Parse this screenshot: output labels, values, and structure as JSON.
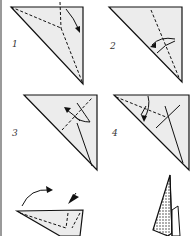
{
  "diagram": {
    "type": "origami-instructions",
    "steps": [
      {
        "number": "1",
        "description": "Triangle with valley folds meeting at center, arrow folding right flap down"
      },
      {
        "number": "2",
        "description": "Triangle with vertical valley fold, curved arrow folding left"
      },
      {
        "number": "3",
        "description": "Triangle with folds, curved arrow folding up-left"
      },
      {
        "number": "4",
        "description": "Triangle with dashed fold line, arrow folding down"
      },
      {
        "number": "",
        "description": "Model with curved arrow turning over and push-in arrow"
      },
      {
        "number": "",
        "description": "Finished shaded pointed model"
      }
    ]
  },
  "colors": {
    "paper": "#ececec",
    "line": "#111111",
    "edge": "#9a9a9a"
  }
}
